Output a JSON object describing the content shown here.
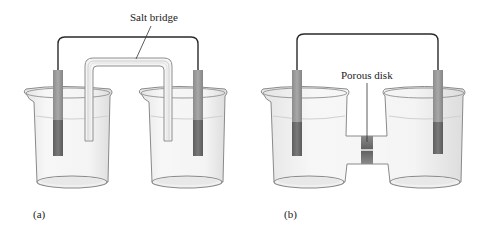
{
  "figure": {
    "panels": [
      {
        "id": "a",
        "caption": "(a)",
        "label": "Salt bridge",
        "description": "Two separate beakers connected by an inverted U-shaped salt bridge tube; electrodes in each beaker joined by an external wire"
      },
      {
        "id": "b",
        "caption": "(b)",
        "label": "Porous disk",
        "description": "Two beakers joined by a horizontal tube containing a porous disk; electrodes in each beaker joined by an external wire"
      }
    ],
    "colors": {
      "wire": "#2a2a2a",
      "electrode_top": "#9a9a9a",
      "electrode_bottom": "#6e6e6e",
      "glass_outline": "#8a8a8a",
      "solution": "#efefef",
      "porous_disk": "#7a7a7a"
    }
  }
}
